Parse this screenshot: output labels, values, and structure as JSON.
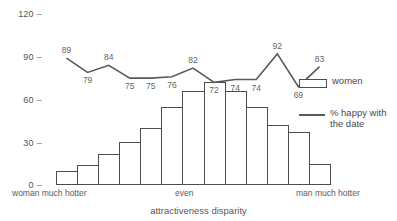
{
  "chart_data": {
    "type": "bar",
    "title": "",
    "xlabel": "attractiveness disparity",
    "ylabel": "",
    "ylim": [
      0,
      120
    ],
    "yticks": [
      0,
      30,
      60,
      90,
      120
    ],
    "grid": false,
    "categories": [
      "1",
      "2",
      "3",
      "4",
      "5",
      "6",
      "7",
      "8",
      "9",
      "10",
      "11",
      "12",
      "13"
    ],
    "category_anchor_labels": {
      "left": "woman much hotter",
      "center": "even",
      "right": "man much hotter"
    },
    "series": [
      {
        "name": "women",
        "type": "bar",
        "values": [
          10,
          14,
          22,
          30,
          40,
          55,
          66,
          72,
          66,
          55,
          42,
          37,
          15
        ]
      },
      {
        "name": "% happy with the date",
        "type": "line",
        "values": [
          89,
          79,
          84,
          75,
          75,
          76,
          82,
          72,
          74,
          74,
          92,
          69,
          83
        ],
        "label_positions": [
          "above",
          "below",
          "above",
          "below",
          "below",
          "below",
          "above",
          "below",
          "below",
          "below",
          "above",
          "below",
          "above"
        ]
      }
    ],
    "legend": {
      "position": "right",
      "entries": [
        {
          "label": "women",
          "marker": "bar-swatch"
        },
        {
          "label": "% happy with\nthe date",
          "marker": "line-swatch"
        }
      ]
    }
  },
  "legend_text": {
    "women": "women",
    "happy_line_1": "% happy with",
    "happy_line_2": "the date"
  },
  "axis_text": {
    "xlabel": "attractiveness disparity",
    "left_anchor": "woman much hotter",
    "center_anchor": "even",
    "right_anchor": "man much hotter",
    "ytick_0": "0",
    "ytick_30": "30",
    "ytick_60": "60",
    "ytick_90": "90",
    "ytick_120": "120",
    "tick_dash": "–"
  },
  "colors": {
    "bar_stroke": "#4d4d4d",
    "bar_fill": "#ffffff",
    "line": "#5a5a5a",
    "text": "#4a4a4a",
    "background": "#ffffff"
  }
}
